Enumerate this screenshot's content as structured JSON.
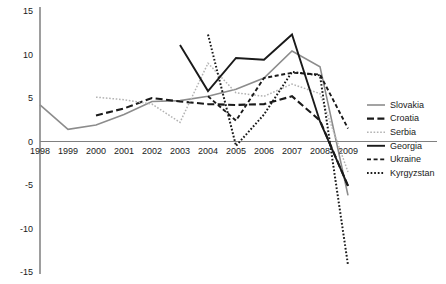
{
  "chart_data": {
    "type": "line",
    "title": "",
    "subtitle": "",
    "xlabel": "",
    "ylabel": "",
    "grid": false,
    "legend_position": "right",
    "x": [
      1998,
      1999,
      2000,
      2001,
      2002,
      2003,
      2004,
      2005,
      2006,
      2007,
      2008,
      2009
    ],
    "xtick_labels": [
      "1998",
      "1999",
      "2000",
      "2001",
      "2002",
      "2003",
      "2004",
      "2005",
      "2006",
      "2007",
      "2008",
      "2009"
    ],
    "ytick_labels": [
      "15",
      "10",
      "5",
      "0",
      "-5",
      "-10",
      "-15"
    ],
    "ytick_values": [
      15,
      10,
      5,
      0,
      -5,
      -10,
      -15
    ],
    "ylim": [
      -15,
      15
    ],
    "xlim": [
      1998,
      2009
    ],
    "series": [
      {
        "name": "Slovakia",
        "style": "solid",
        "color": "#8c8c8c",
        "width": 1.6,
        "x": [
          1998,
          1999,
          2000,
          2001,
          2002,
          2003,
          2004,
          2005,
          2006,
          2007,
          2008,
          2009
        ],
        "values": [
          4.2,
          1.4,
          1.9,
          3.1,
          4.6,
          4.7,
          5.2,
          6.0,
          7.3,
          10.4,
          8.6,
          -6.2
        ]
      },
      {
        "name": "Croatia",
        "style": "long-dash",
        "color": "#1a1a1a",
        "width": 2.1,
        "x": [
          2000,
          2001,
          2002,
          2003,
          2004,
          2005,
          2006,
          2007,
          2008,
          2009
        ],
        "values": [
          3.0,
          3.8,
          5.0,
          4.6,
          4.3,
          4.2,
          4.3,
          5.2,
          2.4,
          -5.1
        ]
      },
      {
        "name": "Serbia",
        "style": "dotted",
        "color": "#b3b3b3",
        "width": 1.5,
        "x": [
          2000,
          2001,
          2002,
          2003,
          2004,
          2005,
          2006,
          2007,
          2008,
          2009
        ],
        "values": [
          5.1,
          4.8,
          4.3,
          2.2,
          9.0,
          5.6,
          5.2,
          6.6,
          5.5,
          -3.5
        ]
      },
      {
        "name": "Georgia",
        "style": "solid",
        "color": "#1a1a1a",
        "width": 1.9,
        "x": [
          2003,
          2004,
          2005,
          2006,
          2007,
          2008,
          2009
        ],
        "values": [
          11.1,
          5.8,
          9.6,
          9.4,
          12.3,
          2.3,
          -5.1
        ]
      },
      {
        "name": "Ukraine",
        "style": "short-dash",
        "color": "#1a1a1a",
        "width": 1.9,
        "x": [
          2004,
          2005,
          2006,
          2007,
          2008,
          2009
        ],
        "values": [
          5.2,
          2.4,
          7.3,
          7.9,
          7.7,
          1.5
        ]
      },
      {
        "name": "Kyrgyzstan",
        "style": "fine-dot",
        "color": "#1a1a1a",
        "width": 2.0,
        "x": [
          2004,
          2005,
          2006,
          2007,
          2008,
          2009
        ],
        "values": [
          12.3,
          -0.5,
          3.1,
          8.0,
          7.6,
          -14.2
        ]
      }
    ],
    "legend": [
      {
        "label": "Slovakia",
        "style": "solid",
        "color": "#8c8c8c",
        "width": 1.6
      },
      {
        "label": "Croatia",
        "style": "long-dash",
        "color": "#1a1a1a",
        "width": 2.1
      },
      {
        "label": "Serbia",
        "style": "dotted",
        "color": "#b3b3b3",
        "width": 1.5
      },
      {
        "label": "Georgia",
        "style": "solid",
        "color": "#1a1a1a",
        "width": 1.9
      },
      {
        "label": "Ukraine",
        "style": "short-dash",
        "color": "#1a1a1a",
        "width": 1.9
      },
      {
        "label": "Kyrgyzstan",
        "style": "fine-dot",
        "color": "#1a1a1a",
        "width": 2.0
      }
    ],
    "axis_color": "#4d4d4d",
    "zero_line_color": "#808080"
  }
}
